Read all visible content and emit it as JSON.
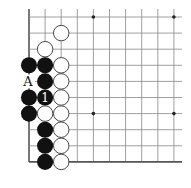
{
  "diagram": {
    "type": "go-board-corner",
    "grid": {
      "origin_x": 29,
      "origin_y": 17,
      "spacing": 16.1,
      "cols": 10,
      "rows": 10,
      "line_extend_right": 182,
      "line_extend_top": 9,
      "line_color": "#888888",
      "edge_color": "#555555"
    },
    "star_points": [
      {
        "col": 4,
        "row": 0
      },
      {
        "col": 9,
        "row": 0
      },
      {
        "col": 4,
        "row": 6
      },
      {
        "col": 9,
        "row": 6
      }
    ],
    "white_stones": [
      {
        "col": 2,
        "row": 1
      },
      {
        "col": 1,
        "row": 2
      },
      {
        "col": 2,
        "row": 3
      },
      {
        "col": 2,
        "row": 4
      },
      {
        "col": 2,
        "row": 5
      },
      {
        "col": 1,
        "row": 6
      },
      {
        "col": 2,
        "row": 6
      },
      {
        "col": 2,
        "row": 7
      },
      {
        "col": 2,
        "row": 8
      },
      {
        "col": 2,
        "row": 9
      }
    ],
    "black_stones": [
      {
        "col": 0,
        "row": 3
      },
      {
        "col": 1,
        "row": 3
      },
      {
        "col": 1,
        "row": 4
      },
      {
        "col": 0,
        "row": 5
      },
      {
        "col": 1,
        "row": 5,
        "label": "1"
      },
      {
        "col": 0,
        "row": 6
      },
      {
        "col": 1,
        "row": 7
      },
      {
        "col": 1,
        "row": 8
      },
      {
        "col": 1,
        "row": 9
      }
    ],
    "point_labels": [
      {
        "col": 0,
        "row": 4,
        "text": "A"
      }
    ],
    "colors": {
      "black_stone": "#111111",
      "white_stone": "#ffffff",
      "white_stone_border": "#333333"
    }
  }
}
